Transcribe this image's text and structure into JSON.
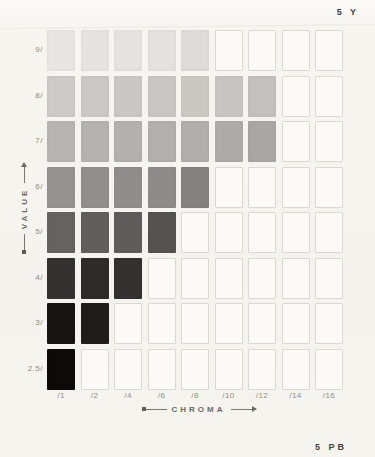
{
  "header": {
    "hue_label": "5 Y"
  },
  "footer": {
    "next_hue_label": "5 PB"
  },
  "axes": {
    "value_label": "VALUE",
    "chroma_label": "CHROMA",
    "row_labels": [
      "9/",
      "8/",
      "7/",
      "6/",
      "5/",
      "4/",
      "3/",
      "2.5/"
    ],
    "column_labels": [
      "/1",
      "/2",
      "/4",
      "/6",
      "/8",
      "/10",
      "/12",
      "/14",
      "/16"
    ]
  },
  "chart_data": {
    "type": "heatmap",
    "xlabel": "CHROMA",
    "ylabel": "VALUE",
    "legend_position": "none",
    "grid": "outlined empty cells where no chip exists",
    "columns": [
      "/1",
      "/2",
      "/4",
      "/6",
      "/8",
      "/10",
      "/12",
      "/14",
      "/16"
    ],
    "rows": [
      {
        "value": "9/",
        "chips": [
          "#e7e6e2",
          "#e5e4e0",
          "#e4e3df",
          "#e3e2de",
          "#dddcd8",
          null,
          null,
          null,
          null
        ]
      },
      {
        "value": "8/",
        "chips": [
          "#cccbc7",
          "#cac9c5",
          "#c9c8c4",
          "#c8c7c3",
          "#c9c8c3",
          "#c6c5c1",
          "#c2c1bd",
          null,
          null
        ]
      },
      {
        "value": "7/",
        "chips": [
          "#b6b5b1",
          "#b4b3af",
          "#b2b1ad",
          "#b1b0ac",
          "#b0afab",
          "#adaca8",
          "#a8a7a3",
          null,
          null
        ]
      },
      {
        "value": "6/",
        "chips": [
          "#949391",
          "#918f8d",
          "#8f8e8c",
          "#8d8c8a",
          "#838280",
          null,
          null,
          null,
          null
        ]
      },
      {
        "value": "5/",
        "chips": [
          "#646361",
          "#615f5d",
          "#5e5d5b",
          "#555351",
          null,
          null,
          null,
          null,
          null
        ]
      },
      {
        "value": "4/",
        "chips": [
          "#343231",
          "#2e2c2b",
          "#333130",
          null,
          null,
          null,
          null,
          null,
          null
        ]
      },
      {
        "value": "3/",
        "chips": [
          "#171514",
          "#1f1d1c",
          null,
          null,
          null,
          null,
          null,
          null,
          null
        ]
      },
      {
        "value": "2.5/",
        "chips": [
          "#0c0b0a",
          null,
          null,
          null,
          null,
          null,
          null,
          null,
          null
        ]
      }
    ]
  }
}
